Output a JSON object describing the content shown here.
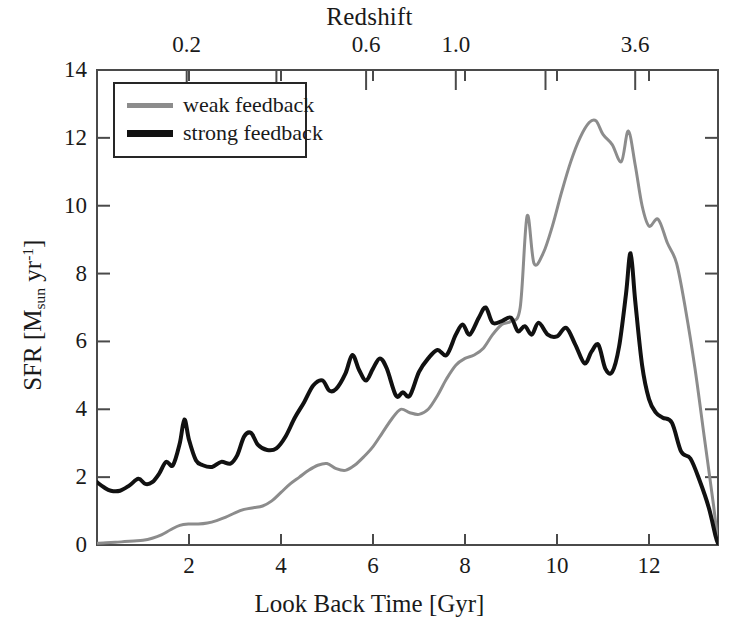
{
  "chart_data": {
    "type": "line",
    "title": "",
    "xlabel": "Look Back Time [Gyr]",
    "ylabel": "SFR [M_sun yr^-1]",
    "ylabel_parts": {
      "prefix": "SFR [M",
      "sub1": "sun",
      "mid": " yr",
      "sup1": "-1",
      "suffix": "]"
    },
    "top_axis_label": "Redshift",
    "xlim": [
      0,
      13.5
    ],
    "ylim": [
      0,
      14
    ],
    "grid": false,
    "legend_position": "top-left",
    "xticks": [
      2,
      4,
      6,
      8,
      10,
      12
    ],
    "xtick_labels": [
      "2",
      "4",
      "6",
      "8",
      "10",
      "12"
    ],
    "yticks": [
      0,
      2,
      4,
      6,
      8,
      10,
      12,
      14
    ],
    "ytick_labels": [
      "0",
      "2",
      "4",
      "6",
      "8",
      "10",
      "12",
      "14"
    ],
    "top_ticks_lookback": [
      1.95,
      3.9,
      5.85,
      7.8,
      9.75,
      11.7
    ],
    "top_tick_labels": [
      "0.2",
      "",
      "0.6",
      "1.0",
      "",
      "3.6"
    ],
    "colors": {
      "weak_feedback": "#8c8c8c",
      "strong_feedback": "#111111",
      "axis": "#4a4a4a",
      "background": "#ffffff"
    },
    "series": [
      {
        "name": "weak feedback",
        "color": "#8c8c8c",
        "linewidth": 3,
        "x": [
          0.0,
          0.2,
          0.4,
          0.6,
          0.8,
          1.0,
          1.2,
          1.4,
          1.6,
          1.8,
          2.0,
          2.2,
          2.4,
          2.6,
          2.8,
          3.0,
          3.2,
          3.4,
          3.6,
          3.8,
          4.0,
          4.2,
          4.4,
          4.6,
          4.8,
          5.0,
          5.2,
          5.4,
          5.6,
          5.8,
          6.0,
          6.2,
          6.4,
          6.6,
          6.8,
          7.0,
          7.2,
          7.4,
          7.6,
          7.8,
          8.0,
          8.2,
          8.4,
          8.6,
          8.8,
          9.0,
          9.2,
          9.35,
          9.5,
          9.7,
          9.9,
          10.1,
          10.3,
          10.5,
          10.7,
          10.85,
          11.0,
          11.2,
          11.4,
          11.55,
          11.7,
          11.85,
          12.0,
          12.2,
          12.4,
          12.6,
          12.8,
          13.0,
          13.2,
          13.4,
          13.5
        ],
        "y": [
          0.05,
          0.07,
          0.08,
          0.1,
          0.12,
          0.14,
          0.2,
          0.3,
          0.45,
          0.58,
          0.62,
          0.62,
          0.65,
          0.72,
          0.82,
          0.95,
          1.05,
          1.1,
          1.15,
          1.3,
          1.55,
          1.8,
          2.0,
          2.2,
          2.35,
          2.4,
          2.25,
          2.2,
          2.35,
          2.6,
          2.9,
          3.3,
          3.7,
          4.0,
          3.9,
          3.85,
          4.0,
          4.4,
          4.9,
          5.3,
          5.5,
          5.6,
          5.8,
          6.2,
          6.5,
          6.6,
          7.0,
          9.7,
          8.3,
          8.6,
          9.4,
          10.4,
          11.3,
          12.0,
          12.45,
          12.5,
          12.1,
          11.8,
          11.3,
          12.2,
          11.2,
          10.0,
          9.4,
          9.6,
          8.9,
          8.3,
          6.9,
          5.2,
          3.2,
          1.2,
          0.05
        ]
      },
      {
        "name": "strong feedback",
        "color": "#111111",
        "linewidth": 4,
        "x": [
          0.0,
          0.15,
          0.3,
          0.5,
          0.7,
          0.9,
          1.05,
          1.2,
          1.35,
          1.5,
          1.65,
          1.8,
          1.9,
          2.0,
          2.15,
          2.3,
          2.5,
          2.7,
          2.9,
          3.05,
          3.2,
          3.35,
          3.5,
          3.7,
          3.9,
          4.1,
          4.3,
          4.5,
          4.7,
          4.9,
          5.05,
          5.2,
          5.4,
          5.55,
          5.7,
          5.85,
          6.0,
          6.15,
          6.3,
          6.5,
          6.65,
          6.8,
          7.0,
          7.2,
          7.4,
          7.6,
          7.8,
          7.95,
          8.1,
          8.3,
          8.45,
          8.6,
          8.8,
          9.0,
          9.15,
          9.3,
          9.45,
          9.6,
          9.8,
          10.0,
          10.2,
          10.4,
          10.6,
          10.75,
          10.9,
          11.05,
          11.2,
          11.35,
          11.5,
          11.6,
          11.7,
          11.85,
          12.0,
          12.15,
          12.3,
          12.5,
          12.7,
          12.9,
          13.1,
          13.3,
          13.45,
          13.5
        ],
        "y": [
          1.85,
          1.7,
          1.6,
          1.6,
          1.75,
          1.95,
          1.8,
          1.85,
          2.1,
          2.45,
          2.35,
          3.0,
          3.7,
          3.1,
          2.5,
          2.35,
          2.3,
          2.45,
          2.4,
          2.65,
          3.2,
          3.3,
          2.95,
          2.8,
          2.85,
          3.2,
          3.75,
          4.2,
          4.7,
          4.85,
          4.55,
          4.6,
          5.05,
          5.6,
          5.15,
          4.85,
          5.2,
          5.5,
          5.2,
          4.4,
          4.5,
          4.4,
          5.1,
          5.5,
          5.75,
          5.6,
          6.2,
          6.5,
          6.2,
          6.7,
          7.0,
          6.55,
          6.6,
          6.7,
          6.3,
          6.45,
          6.2,
          6.55,
          6.2,
          6.15,
          6.4,
          5.9,
          5.35,
          5.7,
          5.9,
          5.2,
          5.1,
          5.85,
          7.4,
          8.6,
          7.2,
          5.3,
          4.3,
          3.9,
          3.75,
          3.6,
          2.75,
          2.55,
          1.9,
          1.1,
          0.25,
          0.05
        ]
      }
    ],
    "legend": [
      {
        "label": "weak feedback",
        "color": "#8c8c8c"
      },
      {
        "label": "strong feedback",
        "color": "#111111"
      }
    ]
  }
}
